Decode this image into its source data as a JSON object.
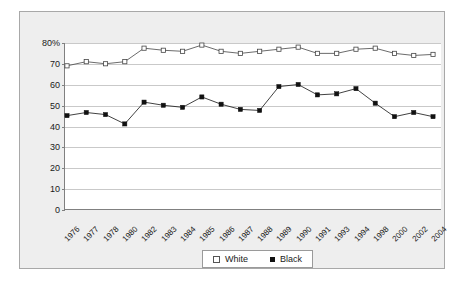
{
  "chart_data": {
    "type": "line",
    "title": "",
    "xlabel": "",
    "ylabel": "",
    "ylim": [
      0,
      80
    ],
    "ytick_labels": [
      "80%",
      "70",
      "60",
      "50",
      "40",
      "30",
      "20",
      "10",
      "0"
    ],
    "yticks": [
      80,
      70,
      60,
      50,
      40,
      30,
      20,
      10,
      0
    ],
    "grid": true,
    "legend_position": "bottom-center",
    "categories": [
      "1976",
      "1977",
      "1978",
      "1980",
      "1982",
      "1983",
      "1984",
      "1985",
      "1986",
      "1987",
      "1988",
      "1989",
      "1990",
      "1991",
      "1993",
      "1994",
      "1998",
      "2000",
      "2002",
      "2004"
    ],
    "series": [
      {
        "name": "White",
        "marker": "open-square",
        "color": "#444444",
        "values": [
          69,
          71,
          70,
          71,
          77.5,
          76.5,
          76,
          79,
          76,
          75,
          76,
          77,
          78,
          75,
          75,
          77,
          77.5,
          75,
          74,
          74.5
        ]
      },
      {
        "name": "Black",
        "marker": "filled-square",
        "color": "#111111",
        "values": [
          45,
          46.5,
          45.5,
          41,
          51.5,
          50,
          49,
          54,
          50.5,
          48,
          47.5,
          59,
          60,
          55,
          55.5,
          58,
          51,
          44.5,
          46.5,
          44.5
        ]
      }
    ]
  },
  "legend": {
    "items": [
      {
        "label": "White"
      },
      {
        "label": "Black"
      }
    ]
  }
}
